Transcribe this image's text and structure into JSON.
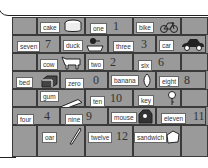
{
  "worksheet": {
    "rows": [
      {
        "cells": [
          {
            "type": "empty"
          },
          {
            "type": "picture",
            "word": "cake",
            "icon": "cake-icon"
          },
          {
            "type": "number",
            "word": "one",
            "numeral": "1"
          },
          {
            "type": "picture",
            "word": "bike",
            "icon": "bike-icon"
          },
          {
            "type": "empty"
          }
        ]
      },
      {
        "cells": [
          {
            "type": "number",
            "word": "seven",
            "numeral": "7"
          },
          {
            "type": "picture",
            "word": "duck",
            "icon": "duck-icon"
          },
          {
            "type": "number",
            "word": "three",
            "numeral": "3"
          },
          {
            "type": "picture",
            "word": "car",
            "icon": "car-icon"
          }
        ]
      },
      {
        "cells": [
          {
            "type": "empty"
          },
          {
            "type": "picture",
            "word": "cow",
            "icon": "cow-icon"
          },
          {
            "type": "number",
            "word": "two",
            "numeral": "2"
          },
          {
            "type": "number",
            "word": "six",
            "numeral": "6"
          },
          {
            "type": "empty"
          }
        ]
      },
      {
        "cells": [
          {
            "type": "picture",
            "word": "bed",
            "icon": "bed-icon"
          },
          {
            "type": "number",
            "word": "zero",
            "numeral": "0"
          },
          {
            "type": "picture",
            "word": "banana",
            "icon": "banana-icon"
          },
          {
            "type": "number",
            "word": "eight",
            "numeral": "8"
          }
        ]
      },
      {
        "cells": [
          {
            "type": "empty"
          },
          {
            "type": "picture",
            "word": "gum",
            "icon": "gum-icon"
          },
          {
            "type": "number",
            "word": "ten",
            "numeral": "10"
          },
          {
            "type": "picture",
            "word": "key",
            "icon": "key-icon"
          },
          {
            "type": "empty"
          }
        ]
      },
      {
        "cells": [
          {
            "type": "number",
            "word": "four",
            "numeral": "4"
          },
          {
            "type": "number",
            "word": "nine",
            "numeral": "9"
          },
          {
            "type": "picture",
            "word": "mouse",
            "icon": "mouse-icon"
          },
          {
            "type": "number",
            "word": "eleven",
            "numeral": "11"
          }
        ]
      },
      {
        "cells": [
          {
            "type": "empty"
          },
          {
            "type": "picture",
            "word": "oar",
            "icon": "oar-icon"
          },
          {
            "type": "number",
            "word": "twelve",
            "numeral": "12"
          },
          {
            "type": "picture",
            "word": "sandwich",
            "icon": "sandwich-icon"
          },
          {
            "type": "empty"
          }
        ]
      }
    ]
  },
  "r": {
    "cake": "cake",
    "one": "one",
    "one_n": "1",
    "bike": "bike",
    "seven": "seven",
    "seven_n": "7",
    "duck": "duck",
    "three": "three",
    "three_n": "3",
    "car": "car",
    "cow": "cow",
    "two": "two",
    "two_n": "2",
    "six": "six",
    "six_n": "6",
    "bed": "bed",
    "zero": "zero",
    "zero_n": "0",
    "banana": "banana",
    "eight": "eight",
    "eight_n": "8",
    "gum": "gum",
    "ten": "ten",
    "ten_n": "10",
    "key": "key",
    "four": "four",
    "four_n": "4",
    "nine": "nine",
    "nine_n": "9",
    "mouse": "mouse",
    "eleven": "eleven",
    "eleven_n": "11",
    "oar": "oar",
    "twelve": "twelve",
    "twelve_n": "12",
    "sandwich": "sandwich"
  }
}
